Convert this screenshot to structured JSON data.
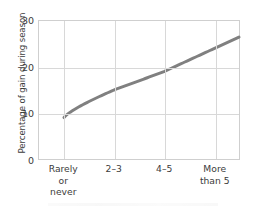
{
  "chart_data": {
    "type": "line",
    "title": "",
    "xlabel": "",
    "ylabel": "Percentage of gain during season",
    "categories": [
      "Rarely or never",
      "2–3",
      "4–5",
      "More than 5"
    ],
    "category_lines": [
      [
        "Rarely",
        "or",
        "never"
      ],
      [
        "2–3"
      ],
      [
        "4–5"
      ],
      [
        "More",
        "than 5"
      ]
    ],
    "values": [
      9,
      15,
      19,
      24
    ],
    "ylim": [
      0,
      30
    ],
    "yticks": [
      0,
      10,
      20,
      30
    ],
    "ytick_labels": [
      "0",
      "10",
      "20",
      "30"
    ],
    "grid": true,
    "legend": "none",
    "series": [
      {
        "name": "Percentage of gain during season",
        "color": "#808080",
        "values": [
          9,
          15,
          19,
          24
        ]
      }
    ],
    "colors": {
      "line": "#808080",
      "grid": "#d8d8d8",
      "frame": "#cfcfcf",
      "text": "#3c3c3c",
      "background": "#ffffff"
    }
  }
}
